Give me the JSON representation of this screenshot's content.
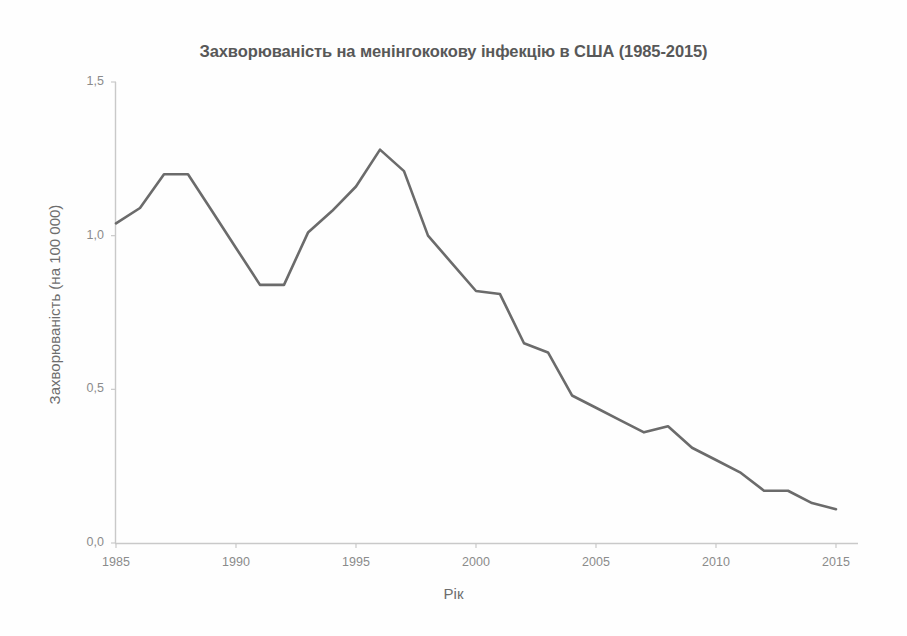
{
  "figure": {
    "title": "Захворюваність на менінгококову інфекцію в США (1985-2015)",
    "x_axis_title": "Рік",
    "y_axis_title": "Захворюваність (на 100 000)",
    "line_color": "#6b6b6b",
    "axis_color": "#c9c9c9",
    "text_color": "#6d6d6d",
    "background_color": "#fefefe"
  },
  "axes": {
    "y_tick_labels": [
      "1,5",
      "1,0",
      "0,5",
      "0,0"
    ],
    "y_tick_values": [
      1.5,
      1.0,
      0.5,
      0.0
    ],
    "x_tick_labels": [
      "1985",
      "1990",
      "1995",
      "2000",
      "2005",
      "2010",
      "2015"
    ],
    "x_tick_values": [
      1985,
      1990,
      1995,
      2000,
      2005,
      2010,
      2015
    ]
  },
  "chart_data": {
    "type": "line",
    "title": "Захворюваність на менінгококову інфекцію в США (1985-2015)",
    "xlabel": "Рік",
    "ylabel": "Захворюваність (на 100 000)",
    "xlim": [
      1985,
      2015
    ],
    "ylim": [
      0.0,
      1.5
    ],
    "grid": false,
    "legend": null,
    "x": [
      1985,
      1986,
      1987,
      1988,
      1989,
      1990,
      1991,
      1992,
      1993,
      1994,
      1995,
      1996,
      1997,
      1998,
      1999,
      2000,
      2001,
      2002,
      2003,
      2004,
      2005,
      2006,
      2007,
      2008,
      2009,
      2010,
      2011,
      2012,
      2013,
      2014,
      2015
    ],
    "values": [
      1.04,
      1.09,
      1.2,
      1.2,
      1.08,
      0.96,
      0.84,
      0.84,
      1.01,
      1.08,
      1.16,
      1.28,
      1.21,
      1.0,
      0.91,
      0.82,
      0.81,
      0.65,
      0.62,
      0.48,
      0.44,
      0.4,
      0.36,
      0.38,
      0.31,
      0.27,
      0.23,
      0.17,
      0.17,
      0.13,
      0.11
    ],
    "series": [
      {
        "name": "Захворюваність (на 100 000)",
        "values": [
          1.04,
          1.09,
          1.2,
          1.2,
          1.08,
          0.96,
          0.84,
          0.84,
          1.01,
          1.08,
          1.16,
          1.28,
          1.21,
          1.0,
          0.91,
          0.82,
          0.81,
          0.65,
          0.62,
          0.48,
          0.44,
          0.4,
          0.36,
          0.38,
          0.31,
          0.27,
          0.23,
          0.17,
          0.17,
          0.13,
          0.11
        ]
      }
    ]
  }
}
